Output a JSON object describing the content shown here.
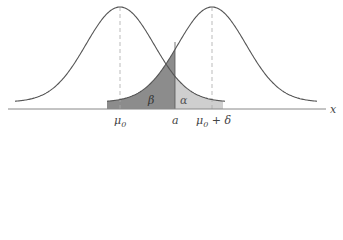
{
  "diagram": {
    "type": "hypothesis-test-normal-curves",
    "axis_label": "x",
    "ticks": [
      {
        "id": "mu0",
        "label": "μ0",
        "base": "μ",
        "sub": "0"
      },
      {
        "id": "a",
        "label": "a"
      },
      {
        "id": "mu0_delta",
        "label": "μ0 + δ",
        "base": "μ",
        "sub": "0",
        "suffix": " + δ"
      }
    ],
    "regions": [
      {
        "id": "beta",
        "label": "β",
        "fill": "#8c8c8c"
      },
      {
        "id": "alpha",
        "label": "α",
        "fill": "#cfcfcf"
      }
    ],
    "colors": {
      "curve": "#555555",
      "axis": "#888888",
      "dashed": "#aaaaaa",
      "beta_fill": "#8c8c8c",
      "alpha_fill": "#cfcfcf"
    }
  }
}
